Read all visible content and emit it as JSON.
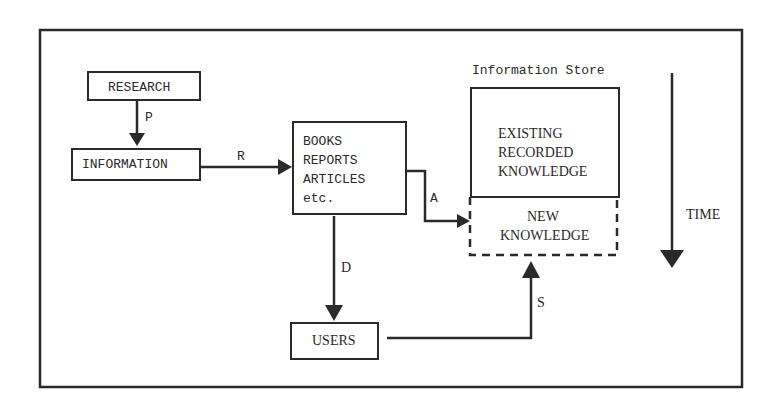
{
  "diagram": {
    "nodes": {
      "research": "RESEARCH",
      "information": "INFORMATION",
      "publications": [
        "BOOKS",
        "REPORTS",
        "ARTICLES",
        "etc."
      ],
      "store_title": "Information Store",
      "existing": [
        "EXISTING",
        "RECORDED",
        "KNOWLEDGE"
      ],
      "new": [
        "NEW",
        "KNOWLEDGE"
      ],
      "users": "USERS"
    },
    "edges": {
      "p": "P",
      "r": "R",
      "a": "A",
      "d": "D",
      "s": "S"
    },
    "time_label": "TIME",
    "colors": {
      "ink": "#2a2a2a",
      "background": "#ffffff"
    }
  }
}
